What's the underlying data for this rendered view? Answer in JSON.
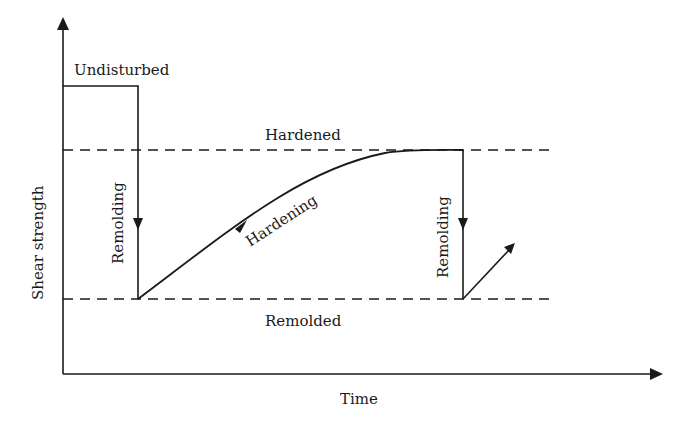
{
  "diagram": {
    "type": "shear-strength-vs-time",
    "axes": {
      "x_label": "Time",
      "y_label": "Shear strength"
    },
    "levels": {
      "undisturbed": "Undisturbed",
      "hardened": "Hardened",
      "remolded": "Remolded"
    },
    "processes": {
      "remolding_1": "Remolding",
      "hardening": "Hardening",
      "remolding_2": "Remolding"
    },
    "colors": {
      "line": "#1a1a1a",
      "background": "#ffffff"
    }
  }
}
